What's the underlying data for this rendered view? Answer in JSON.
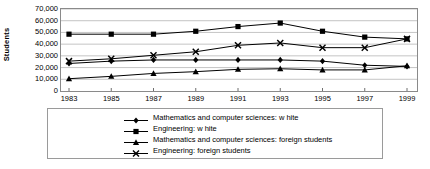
{
  "chart_data": {
    "type": "line",
    "title": "",
    "xlabel": "",
    "ylabel": "Students",
    "x": [
      1983,
      1985,
      1987,
      1989,
      1991,
      1993,
      1995,
      1997,
      1999
    ],
    "categories": [
      "1983",
      "1985",
      "1987",
      "1989",
      "1991",
      "1993",
      "1995",
      "1997",
      "1999"
    ],
    "ylim": [
      0,
      70000
    ],
    "ytick_values": [
      0,
      10000,
      20000,
      30000,
      40000,
      50000,
      60000,
      70000
    ],
    "ytick_labels": [
      "0",
      "10,000",
      "20,000",
      "30,000",
      "40,000",
      "50,000",
      "60,000",
      "70,000"
    ],
    "grid": true,
    "grid_axis": "y",
    "legend_position": "bottom",
    "series": [
      {
        "name": "Mathematics and computer sciences: w hite",
        "marker": "diamond",
        "values": [
          23500,
          25500,
          26500,
          26500,
          26500,
          26500,
          25500,
          22000,
          21000
        ]
      },
      {
        "name": "Engineering: w hite",
        "marker": "square",
        "values": [
          48500,
          48500,
          48500,
          51000,
          55000,
          58000,
          51000,
          46000,
          44500
        ]
      },
      {
        "name": "Mathematics and computer sciences: foreign students",
        "marker": "triangle",
        "values": [
          10500,
          12500,
          15000,
          16500,
          18500,
          19000,
          18000,
          18000,
          21500
        ]
      },
      {
        "name": "Engineering: foreign students",
        "marker": "x",
        "values": [
          25500,
          27500,
          30500,
          33500,
          39000,
          41000,
          37000,
          37000,
          44500
        ]
      }
    ]
  },
  "axis": {
    "ylabel": "Students",
    "ytick_labels": [
      "70,000",
      "60,000",
      "50,000",
      "40,000",
      "30,000",
      "20,000",
      "10,000",
      "0"
    ],
    "xtick_labels": [
      "1983",
      "1985",
      "1987",
      "1989",
      "1991",
      "1993",
      "1995",
      "1997",
      "1999"
    ]
  },
  "legend": {
    "items": [
      {
        "label": "Mathematics and computer sciences: w hite",
        "marker": "diamond-marker"
      },
      {
        "label": "Engineering: w hite",
        "marker": "square-marker"
      },
      {
        "label": "Mathematics and computer sciences: foreign students",
        "marker": "triangle-marker"
      },
      {
        "label": "Engineering: foreign students",
        "marker": "x-marker"
      }
    ]
  },
  "colors": {
    "line": "#000000",
    "grid": "#b5b5b5",
    "frame": "#8a8a8a",
    "background": "#ffffff"
  }
}
